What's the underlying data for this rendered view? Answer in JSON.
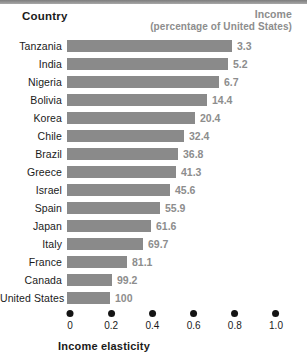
{
  "header": {
    "country_label": "Country",
    "income_label": "Income",
    "income_sublabel": "(percentage of United States)"
  },
  "axis": {
    "x_title": "Income elasticity",
    "ticks": [
      "0",
      "0.2",
      "0.4",
      "0.6",
      "0.8",
      "1.0"
    ]
  },
  "colors": {
    "bar": "#8a8a8a",
    "value_text": "#8d8d8d",
    "label_text": "#1a1a1a",
    "tick_dot": "#141414",
    "background": "#ffffff",
    "top_band": "#8d8d8d"
  },
  "chart_data": {
    "type": "bar",
    "orientation": "horizontal",
    "title": "",
    "subtitle": "",
    "xlabel": "Income elasticity",
    "ylabel": "Country",
    "xlim": [
      0,
      1.0
    ],
    "xticks": [
      0,
      0.2,
      0.4,
      0.6,
      0.8,
      1.0
    ],
    "grid": false,
    "legend": "none",
    "categories": [
      "Tanzania",
      "India",
      "Nigeria",
      "Bolivia",
      "Korea",
      "Chile",
      "Brazil",
      "Greece",
      "Israel",
      "Spain",
      "Japan",
      "Italy",
      "France",
      "Canada",
      "United States"
    ],
    "series": [
      {
        "name": "Income elasticity",
        "values": [
          0.8,
          0.78,
          0.74,
          0.68,
          0.62,
          0.57,
          0.54,
          0.53,
          0.5,
          0.45,
          0.41,
          0.37,
          0.29,
          0.22,
          0.21
        ]
      }
    ],
    "data_labels": {
      "name": "Income (percentage of United States)",
      "values": [
        "3.3",
        "5.2",
        "6.7",
        "14.4",
        "20.4",
        "32.4",
        "36.8",
        "41.3",
        "45.6",
        "55.9",
        "61.6",
        "69.7",
        "81.1",
        "99.2",
        "100"
      ]
    },
    "rows": [
      {
        "country": "Tanzania",
        "elasticity": 0.8,
        "income": "3.3"
      },
      {
        "country": "India",
        "elasticity": 0.78,
        "income": "5.2"
      },
      {
        "country": "Nigeria",
        "elasticity": 0.74,
        "income": "6.7"
      },
      {
        "country": "Bolivia",
        "elasticity": 0.68,
        "income": "14.4"
      },
      {
        "country": "Korea",
        "elasticity": 0.62,
        "income": "20.4"
      },
      {
        "country": "Chile",
        "elasticity": 0.57,
        "income": "32.4"
      },
      {
        "country": "Brazil",
        "elasticity": 0.54,
        "income": "36.8"
      },
      {
        "country": "Greece",
        "elasticity": 0.53,
        "income": "41.3"
      },
      {
        "country": "Israel",
        "elasticity": 0.5,
        "income": "45.6"
      },
      {
        "country": "Spain",
        "elasticity": 0.45,
        "income": "55.9"
      },
      {
        "country": "Japan",
        "elasticity": 0.41,
        "income": "61.6"
      },
      {
        "country": "Italy",
        "elasticity": 0.37,
        "income": "69.7"
      },
      {
        "country": "France",
        "elasticity": 0.29,
        "income": "81.1"
      },
      {
        "country": "Canada",
        "elasticity": 0.22,
        "income": "99.2"
      },
      {
        "country": "United States",
        "elasticity": 0.21,
        "income": "100"
      }
    ]
  }
}
